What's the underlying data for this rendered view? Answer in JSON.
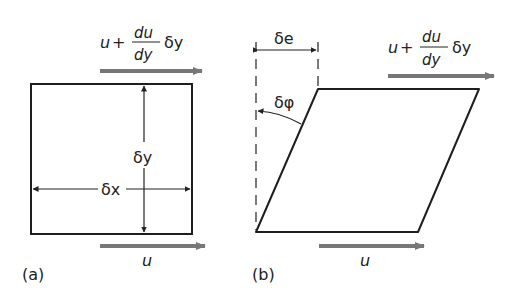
{
  "figure": {
    "panel_a": {
      "label": "(a)",
      "top_velocity": {
        "u": "u",
        "plus": "+",
        "num": "du",
        "den": "dy",
        "delta": "δy"
      },
      "bottom_velocity": "u",
      "height_label": "δy",
      "width_label": "δx"
    },
    "panel_b": {
      "label": "(b)",
      "top_velocity": {
        "u": "u",
        "plus": "+",
        "num": "du",
        "den": "dy",
        "delta": "δy"
      },
      "bottom_velocity": "u",
      "displacement_label": "δe",
      "angle_label": "δφ"
    },
    "colors": {
      "outline": "#1e1e1e",
      "arrow": "#777777",
      "text": "#222222"
    }
  }
}
